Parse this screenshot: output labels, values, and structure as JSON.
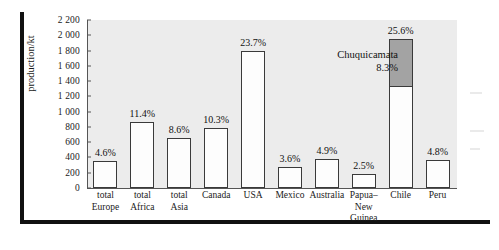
{
  "chart_data": {
    "type": "bar",
    "title": "",
    "xlabel": "",
    "ylabel": "production/kt",
    "ylim": [
      0,
      2200
    ],
    "yticks": [
      0,
      200,
      400,
      600,
      800,
      1000,
      1200,
      1400,
      1600,
      1800,
      2000,
      2200
    ],
    "ytick_labels": [
      "0",
      "200",
      "400",
      "600",
      "800",
      "1 000",
      "1 200",
      "1 400",
      "1 600",
      "1 800",
      "2 000",
      "2 200"
    ],
    "grid": false,
    "legend": "none",
    "categories": [
      "total Europe",
      "total Africa",
      "total Asia",
      "Canada",
      "USA",
      "Mexico",
      "Australia",
      "Papua–New Guinea",
      "Chile",
      "Peru"
    ],
    "category_lines": [
      [
        "total",
        "Europe"
      ],
      [
        "total",
        "Africa"
      ],
      [
        "total",
        "Asia"
      ],
      [
        "Canada"
      ],
      [
        "USA"
      ],
      [
        "Mexico"
      ],
      [
        "Australia"
      ],
      [
        "Papua–",
        "New",
        "Guinea"
      ],
      [
        "Chile"
      ],
      [
        "Peru"
      ]
    ],
    "values": [
      350,
      870,
      655,
      785,
      1800,
      275,
      375,
      190,
      1950,
      365
    ],
    "data_labels": [
      "4.6%",
      "11.4%",
      "8.6%",
      "10.3%",
      "23.7%",
      "3.6%",
      "4.9%",
      "2.5%",
      "25.6%",
      "4.8%"
    ],
    "stacked_segment": {
      "category": "Chile",
      "name": "Chuquicamata",
      "label": "8.3%",
      "value": 630,
      "base_value": 1320,
      "color": "#a3a3a3"
    },
    "annotation": {
      "line1": "Chuquicamata",
      "line2": "8.3%"
    },
    "colors": {
      "bar_fill": "#fdfdfd",
      "bar_stroke": "#3a3a3a",
      "highlight_fill": "#a3a3a3",
      "plot_background": "#ececec",
      "axis": "#555555",
      "text": "#1a1a1a",
      "frame": "#111111"
    }
  }
}
